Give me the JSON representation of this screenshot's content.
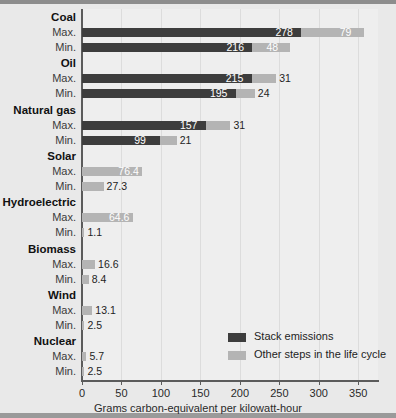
{
  "chart_data": {
    "type": "bar",
    "orientation": "horizontal",
    "stacked": true,
    "title": "",
    "xlabel": "Grams carbon-equivalent per kilowatt-hour",
    "ylabel": "",
    "xlim": [
      0,
      375
    ],
    "xticks": [
      0,
      50,
      100,
      150,
      200,
      250,
      300,
      350
    ],
    "xtick_labels": [
      "0",
      "50",
      "100",
      "150",
      "200",
      "250",
      "300",
      "350"
    ],
    "grid": "vertical",
    "legend_position": "inside-bottom-right",
    "series": [
      {
        "name": "Stack emissions",
        "color": "#3d3d3d"
      },
      {
        "name": "Other steps in the life cycle",
        "color": "#b4b4b4"
      }
    ],
    "categories": [
      "Coal",
      "Oil",
      "Natural gas",
      "Solar",
      "Hydroelectric",
      "Biomass",
      "Wind",
      "Nuclear"
    ],
    "row_labels": [
      "Max.",
      "Min."
    ],
    "groups": [
      {
        "category": "Coal",
        "rows": [
          {
            "label": "Max.",
            "stack": 278,
            "other": 79,
            "stack_text": "278",
            "other_text": "79"
          },
          {
            "label": "Min.",
            "stack": 216,
            "other": 48,
            "stack_text": "216",
            "other_text": "48"
          }
        ]
      },
      {
        "category": "Oil",
        "rows": [
          {
            "label": "Max.",
            "stack": 215,
            "other": 31,
            "stack_text": "215",
            "other_text": "31"
          },
          {
            "label": "Min.",
            "stack": 195,
            "other": 24,
            "stack_text": "195",
            "other_text": "24"
          }
        ]
      },
      {
        "category": "Natural gas",
        "rows": [
          {
            "label": "Max.",
            "stack": 157,
            "other": 31,
            "stack_text": "157",
            "other_text": "31"
          },
          {
            "label": "Min.",
            "stack": 99,
            "other": 21,
            "stack_text": "99",
            "other_text": "21"
          }
        ]
      },
      {
        "category": "Solar",
        "rows": [
          {
            "label": "Max.",
            "stack": 0,
            "other": 76.4,
            "stack_text": "",
            "other_text": "76.4"
          },
          {
            "label": "Min.",
            "stack": 0,
            "other": 27.3,
            "stack_text": "",
            "other_text": "27.3"
          }
        ]
      },
      {
        "category": "Hydroelectric",
        "rows": [
          {
            "label": "Max.",
            "stack": 0,
            "other": 64.6,
            "stack_text": "",
            "other_text": "64.6"
          },
          {
            "label": "Min.",
            "stack": 0,
            "other": 1.1,
            "stack_text": "",
            "other_text": "1.1"
          }
        ]
      },
      {
        "category": "Biomass",
        "rows": [
          {
            "label": "Max.",
            "stack": 0,
            "other": 16.6,
            "stack_text": "",
            "other_text": "16.6"
          },
          {
            "label": "Min.",
            "stack": 0,
            "other": 8.4,
            "stack_text": "",
            "other_text": "8.4"
          }
        ]
      },
      {
        "category": "Wind",
        "rows": [
          {
            "label": "Max.",
            "stack": 0,
            "other": 13.1,
            "stack_text": "",
            "other_text": "13.1"
          },
          {
            "label": "Min.",
            "stack": 0,
            "other": 2.5,
            "stack_text": "",
            "other_text": "2.5"
          }
        ]
      },
      {
        "category": "Nuclear",
        "rows": [
          {
            "label": "Max.",
            "stack": 0,
            "other": 5.7,
            "stack_text": "",
            "other_text": "5.7"
          },
          {
            "label": "Min.",
            "stack": 0,
            "other": 2.5,
            "stack_text": "",
            "other_text": "2.5"
          }
        ]
      }
    ]
  },
  "colors": {
    "stack": "#3d3d3d",
    "other": "#b4b4b4",
    "plot_background": "#eeeeee",
    "page_background": "#e9e9e9",
    "axis": "#5b5b5b",
    "gridline": "#dcdcdc"
  }
}
